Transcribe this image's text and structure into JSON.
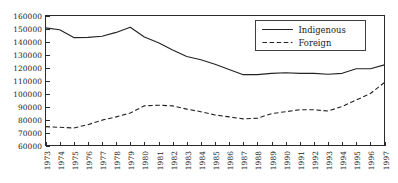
{
  "chart_data": {
    "type": "line",
    "title": "",
    "xlabel": "",
    "ylabel": "",
    "grid": false,
    "legend_position": "top-right",
    "ylim": [
      60000,
      160000
    ],
    "yticks": [
      60000,
      70000,
      80000,
      90000,
      100000,
      110000,
      120000,
      130000,
      140000,
      150000,
      160000
    ],
    "ytick_labels": [
      "60000",
      "70000",
      "80000",
      "90000",
      "100000",
      "110000",
      "120000",
      "130000",
      "140000",
      "150000",
      "160000"
    ],
    "categories": [
      "1973",
      "1974",
      "1975",
      "1976",
      "1977",
      "1978",
      "1979",
      "1980",
      "1981",
      "1982",
      "1983",
      "1984",
      "1985",
      "1986",
      "1987",
      "1988",
      "1989",
      "1990",
      "1991",
      "1992",
      "1993",
      "1994",
      "1995",
      "1996",
      "1997"
    ],
    "x": [
      1973,
      1974,
      1975,
      1976,
      1977,
      1978,
      1979,
      1980,
      1981,
      1982,
      1983,
      1984,
      1985,
      1986,
      1987,
      1988,
      1989,
      1990,
      1991,
      1992,
      1993,
      1994,
      1995,
      1996,
      1997
    ],
    "series": [
      {
        "name": "Indigenous",
        "style": "solid",
        "color": "#222222",
        "values": [
          150500,
          149000,
          143000,
          143200,
          144000,
          147000,
          151000,
          143500,
          139000,
          133500,
          128500,
          126000,
          122500,
          118500,
          114500,
          114500,
          115500,
          116000,
          115500,
          115500,
          114800,
          115500,
          119000,
          119000,
          122000
        ]
      },
      {
        "name": "Foreign",
        "style": "dashed",
        "color": "#222222",
        "values": [
          74500,
          74000,
          73500,
          76000,
          79500,
          82000,
          85000,
          90500,
          91000,
          90500,
          88000,
          86000,
          83500,
          82000,
          80500,
          81000,
          84500,
          86000,
          87500,
          87500,
          86500,
          90000,
          95000,
          100000,
          108500
        ]
      }
    ],
    "legend": [
      {
        "label": "Indigenous",
        "style": "solid"
      },
      {
        "label": "Foreign",
        "style": "dashed"
      }
    ]
  }
}
